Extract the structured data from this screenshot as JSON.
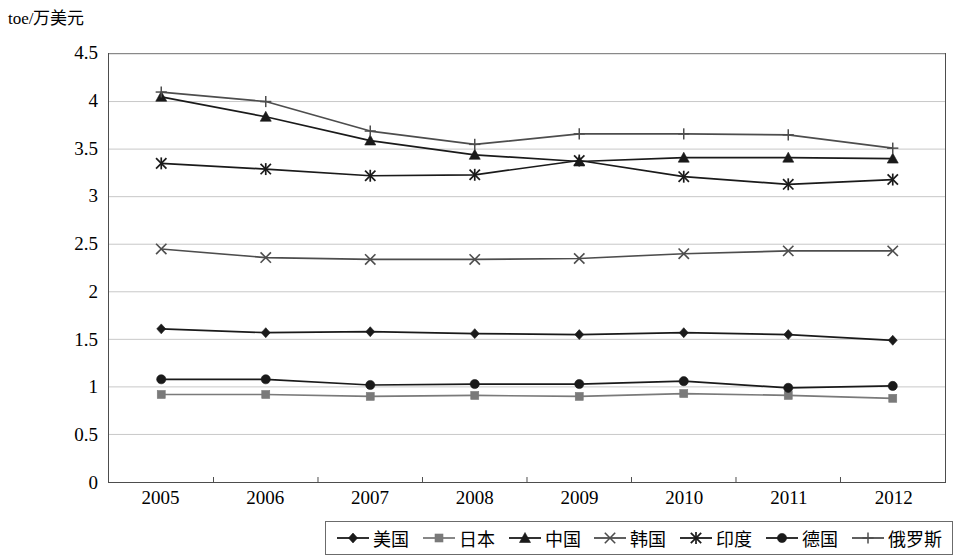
{
  "axis": {
    "unit_label": "toe/万美元",
    "y_ticks": [
      "4.5",
      "4",
      "3.5",
      "3",
      "2.5",
      "2",
      "1.5",
      "1",
      "0.5",
      "0"
    ],
    "x_ticks": [
      "2005",
      "2006",
      "2007",
      "2008",
      "2009",
      "2010",
      "2011",
      "2012"
    ]
  },
  "legend": {
    "items": [
      {
        "label": "美国",
        "marker": "diamond-marker",
        "color": "#1a1a1a"
      },
      {
        "label": "日本",
        "marker": "square-marker",
        "color": "#7a7a7a"
      },
      {
        "label": "中国",
        "marker": "triangle-marker",
        "color": "#1a1a1a"
      },
      {
        "label": "韩国",
        "marker": "cross-x-marker",
        "color": "#4d4d4d"
      },
      {
        "label": "印度",
        "marker": "asterisk-marker",
        "color": "#1a1a1a"
      },
      {
        "label": "德国",
        "marker": "circle-marker",
        "color": "#1a1a1a"
      },
      {
        "label": "俄罗斯",
        "marker": "plus-marker",
        "color": "#4d4d4d"
      }
    ]
  },
  "chart_data": {
    "type": "line",
    "title": "",
    "xlabel": "",
    "ylabel": "toe/万美元",
    "categories": [
      "2005",
      "2006",
      "2007",
      "2008",
      "2009",
      "2010",
      "2011",
      "2012"
    ],
    "ylim": [
      0,
      4.5
    ],
    "ytick_step": 0.5,
    "grid": true,
    "legend_position": "bottom",
    "series": [
      {
        "name": "美国",
        "marker": "diamond",
        "color": "#1a1a1a",
        "values": [
          1.61,
          1.57,
          1.58,
          1.56,
          1.55,
          1.57,
          1.55,
          1.49
        ]
      },
      {
        "name": "日本",
        "marker": "square",
        "color": "#7a7a7a",
        "values": [
          0.92,
          0.92,
          0.9,
          0.91,
          0.9,
          0.93,
          0.91,
          0.88
        ]
      },
      {
        "name": "中国",
        "marker": "triangle",
        "color": "#1a1a1a",
        "values": [
          4.05,
          3.84,
          3.59,
          3.44,
          3.37,
          3.41,
          3.41,
          3.4
        ]
      },
      {
        "name": "韩国",
        "marker": "cross-x",
        "color": "#4d4d4d",
        "values": [
          2.45,
          2.36,
          2.34,
          2.34,
          2.35,
          2.4,
          2.43,
          2.43
        ]
      },
      {
        "name": "印度",
        "marker": "asterisk",
        "color": "#1a1a1a",
        "values": [
          3.35,
          3.29,
          3.22,
          3.23,
          3.38,
          3.21,
          3.13,
          3.18
        ]
      },
      {
        "name": "德国",
        "marker": "circle",
        "color": "#1a1a1a",
        "values": [
          1.08,
          1.08,
          1.02,
          1.03,
          1.03,
          1.06,
          0.99,
          1.01
        ]
      },
      {
        "name": "俄罗斯",
        "marker": "plus",
        "color": "#4d4d4d",
        "values": [
          4.1,
          4.0,
          3.69,
          3.55,
          3.66,
          3.66,
          3.65,
          3.51
        ]
      }
    ]
  }
}
